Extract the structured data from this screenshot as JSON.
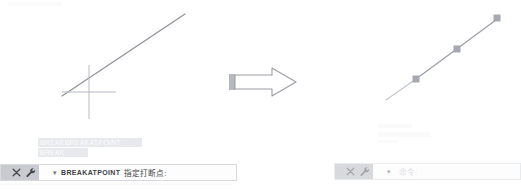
{
  "illustration": {
    "title_hint": "BREAKATPOINT command before and after",
    "arrow": {
      "name": "right-block-arrow",
      "direction": "right",
      "fill": "#ffffff",
      "stroke": "#9a9da3",
      "tail_fill": "#b5b8bd"
    }
  },
  "before": {
    "label": "before-state",
    "line": {
      "x1": 62,
      "y1": 96,
      "x2": 185,
      "y2": 14,
      "color": "#8d9097"
    },
    "crosshair": {
      "cx": 89,
      "cy": 92,
      "arm": 27,
      "color": "#b7bac0"
    }
  },
  "after": {
    "label": "after-state",
    "line": {
      "x1": 386,
      "y1": 100,
      "x2": 500,
      "y2": 17,
      "color": "#9a9da3"
    },
    "grips": [
      {
        "name": "grip-point-1",
        "cx": 416,
        "cy": 79,
        "size": 7,
        "color": "#a6a9af"
      },
      {
        "name": "grip-point-2",
        "cx": 457,
        "cy": 49,
        "size": 7,
        "color": "#a6a9af"
      },
      {
        "name": "grip-point-3",
        "cx": 497,
        "cy": 18,
        "size": 7,
        "color": "#a6a9af"
      }
    ]
  },
  "suggestions": {
    "visible": true,
    "items": [
      {
        "prefix": "BREAK",
        "label": "BREAKATPOINT"
      },
      {
        "prefix": "",
        "label": "BREAK"
      }
    ]
  },
  "command_line_left": {
    "tools": {
      "drag_handle": "drag-handle",
      "close_label": "✕",
      "customize_label": "wrench"
    },
    "caret": "▾",
    "command": "BREAKATPOINT",
    "prompt": "指定打断点:"
  },
  "command_line_right": {
    "tools": {
      "drag_handle": "drag-handle",
      "close_label": "✕",
      "customize_label": "wrench"
    },
    "caret": "▾",
    "command": "",
    "prompt": "命令:"
  },
  "colors": {
    "line": "#8d9097",
    "grip": "#a6a9af",
    "crosshair": "#b7bac0",
    "toolbar": "#c9cbd0",
    "bar_bg": "#fcfcfc",
    "bar_border": "#d7d9dd",
    "suggest_bg": "#b9bec6"
  }
}
